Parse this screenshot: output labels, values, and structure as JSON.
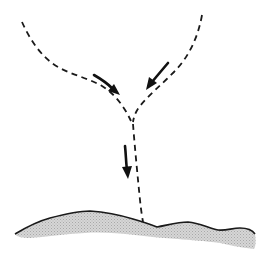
{
  "diagram": {
    "colors": {
      "background": "#ffffff",
      "line": "#1a1a1a",
      "ground_shade": "#c8c8c8"
    },
    "paths": [
      {
        "name": "left-branch",
        "style": "dashed",
        "points": [
          [
            22,
            22
          ],
          [
            38,
            48
          ],
          [
            55,
            66
          ],
          [
            80,
            77
          ],
          [
            100,
            88
          ],
          [
            118,
            104
          ],
          [
            130,
            120
          ]
        ]
      },
      {
        "name": "right-branch",
        "style": "dashed",
        "points": [
          [
            202,
            15
          ],
          [
            196,
            40
          ],
          [
            182,
            63
          ],
          [
            162,
            86
          ],
          [
            145,
            104
          ],
          [
            134,
            118
          ]
        ]
      },
      {
        "name": "stem",
        "style": "dashed",
        "points": [
          [
            133,
            124
          ],
          [
            136,
            160
          ],
          [
            140,
            195
          ],
          [
            143,
            222
          ]
        ]
      }
    ],
    "arrows": [
      {
        "name": "left-flow-arrow",
        "from": [
          94,
          75
        ],
        "to": [
          119,
          94
        ],
        "direction": "down-right"
      },
      {
        "name": "right-flow-arrow",
        "from": [
          168,
          63
        ],
        "to": [
          147,
          89
        ],
        "direction": "down-left"
      },
      {
        "name": "down-flow-arrow",
        "from": [
          125,
          146
        ],
        "to": [
          128,
          178
        ],
        "direction": "down"
      }
    ],
    "ground": {
      "name": "ground-surface",
      "style": "solid line with shaded fill below"
    }
  }
}
